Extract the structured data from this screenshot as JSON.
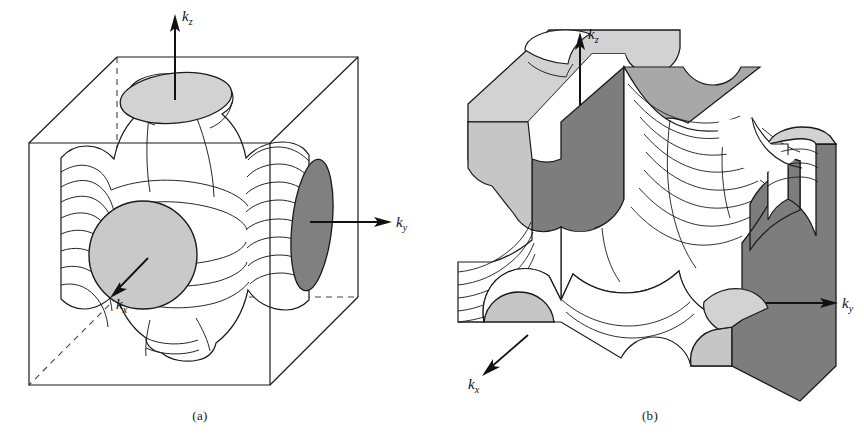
{
  "figure": {
    "type": "scientific-illustration",
    "panels": [
      {
        "id": "a",
        "caption": "(a)",
        "content": "Fermi surface inside a cubic Brillouin zone box with necks contacting the zone faces",
        "axes": [
          {
            "name": "kz",
            "label_base": "k",
            "label_sub": "z",
            "direction": "up"
          },
          {
            "name": "ky",
            "label_base": "k",
            "label_sub": "y",
            "direction": "right"
          },
          {
            "name": "kx",
            "label_base": "k",
            "label_sub": "x",
            "direction": "down-left"
          }
        ],
        "features": [
          {
            "name": "top-neck-cap",
            "shade": "light"
          },
          {
            "name": "front-neck-cap",
            "shade": "light"
          },
          {
            "name": "right-neck-cap",
            "shade": "dark"
          },
          {
            "name": "bounding-cube",
            "shade": "none"
          }
        ]
      },
      {
        "id": "b",
        "caption": "(b)",
        "content": "Repeated-zone corrugated Fermi surface slab with cut faces shaded",
        "axes": [
          {
            "name": "kz",
            "label_base": "k",
            "label_sub": "z",
            "direction": "up"
          },
          {
            "name": "ky",
            "label_base": "k",
            "label_sub": "y",
            "direction": "right"
          },
          {
            "name": "kx",
            "label_base": "k",
            "label_sub": "x",
            "direction": "down-left"
          }
        ],
        "features": [
          {
            "name": "top-cut-plane",
            "shade": "light"
          },
          {
            "name": "side-cut-plane",
            "shade": "dark"
          },
          {
            "name": "neck-cap-front-left",
            "shade": "light"
          },
          {
            "name": "neck-cap-front-right",
            "shade": "light"
          },
          {
            "name": "neck-cap-upper-right",
            "shade": "light"
          }
        ]
      }
    ]
  },
  "labels": {
    "kz": {
      "base": "k",
      "sub": "z"
    },
    "ky": {
      "base": "k",
      "sub": "y"
    },
    "kx": {
      "base": "k",
      "sub": "x"
    }
  },
  "captions": {
    "a": "(a)",
    "b": "(b)"
  },
  "colors": {
    "background": "#ffffff",
    "stroke": "#1a1a1a",
    "light_shade": "#d2d2d2",
    "dark_shade": "#808080",
    "mid_shade": "#bdbdbd",
    "dashed_stroke": "#555555"
  }
}
